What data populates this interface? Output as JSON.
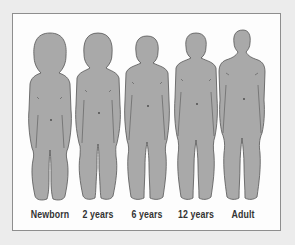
{
  "figure": {
    "colors": {
      "body_fill": "#a9a9a9",
      "outline": "#555555",
      "frame_border": "#8e8e8e",
      "background": "#ececec",
      "panel": "#fdfdfd",
      "label": "#333333"
    },
    "stages": [
      {
        "label": "Newborn",
        "center_x": 50
      },
      {
        "label": "2 years",
        "center_x": 98
      },
      {
        "label": "6 years",
        "center_x": 147
      },
      {
        "label": "12 years",
        "center_x": 196
      },
      {
        "label": "Adult",
        "center_x": 243
      }
    ]
  }
}
